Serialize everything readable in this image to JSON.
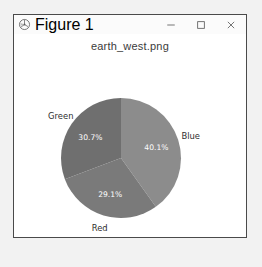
{
  "window": {
    "title": "Figure 1",
    "app_icon": "matplotlib-icon",
    "controls": {
      "minimize": "minimize-icon",
      "maximize": "maximize-icon",
      "close": "close-icon"
    }
  },
  "chart_data": {
    "type": "pie",
    "title": "earth_west.png",
    "xlabel": "",
    "ylabel": "",
    "legend": "none",
    "grid": false,
    "startangle": 90,
    "direction": "clockwise",
    "categories": [
      "Blue",
      "Green",
      "Red"
    ],
    "values": [
      40.1,
      30.7,
      29.1
    ],
    "labels": [
      "Blue",
      "Green",
      "Red"
    ],
    "autopct_labels": [
      "40.1%",
      "29.1%",
      "30.7%"
    ],
    "slices": [
      {
        "label": "Blue",
        "pct_text": "40.1%",
        "value": 40.1,
        "color": "#8c8c8c"
      },
      {
        "label": "Red",
        "pct_text": "29.1%",
        "value": 29.1,
        "color": "#7a7a7a"
      },
      {
        "label": "Green",
        "pct_text": "30.7%",
        "value": 30.7,
        "color": "#6f6f6f"
      }
    ]
  }
}
